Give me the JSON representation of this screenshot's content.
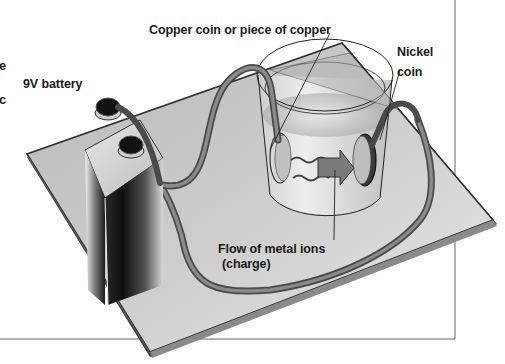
{
  "diagram": {
    "labels": {
      "battery": "9V battery",
      "copper": "Copper coin or piece of copper",
      "nickel_line1": "Nickel",
      "nickel_line2": "coin",
      "flow_line1": "Flow of metal ions",
      "flow_line2": "(charge)"
    },
    "cut_off_text_fragments": [
      "e",
      "c"
    ],
    "components": [
      {
        "name": "9V battery",
        "icon": "battery-icon"
      },
      {
        "name": "Wires",
        "icon": "wire-icon"
      },
      {
        "name": "Cup of solution",
        "icon": "beaker-icon"
      },
      {
        "name": "Copper coin",
        "icon": "coin-icon"
      },
      {
        "name": "Nickel coin",
        "icon": "coin-icon"
      },
      {
        "name": "Base board",
        "icon": "board-icon"
      }
    ],
    "colors": {
      "board": "#c8c8c8",
      "board_edge": "#3a3a3a",
      "wire": "#6e6e6e",
      "battery_dark": "#141414",
      "text": "#1a1a1a",
      "frame_line": "#555555"
    }
  }
}
